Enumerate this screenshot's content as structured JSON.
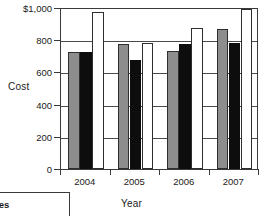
{
  "chart_data": {
    "type": "bar",
    "title": "",
    "xlabel": "Year",
    "ylabel": "Cost",
    "categories": [
      "2004",
      "2005",
      "2006",
      "2007"
    ],
    "series": [
      {
        "name": "series-gray",
        "color": "#8d8d8d",
        "values": [
          727,
          776,
          735,
          870
        ]
      },
      {
        "name": "series-black",
        "color": "#0d0d0d",
        "values": [
          727,
          677,
          776,
          782
        ]
      },
      {
        "name": "series-white",
        "color": "#ffffff",
        "values": [
          975,
          782,
          876,
          993
        ]
      }
    ],
    "ylim": [
      0,
      1000
    ],
    "yticks": [
      0,
      200,
      400,
      600,
      800,
      1000
    ],
    "ytick_labels": [
      "0",
      "200",
      "400",
      "600",
      "800",
      "$1,000"
    ],
    "grid": true,
    "legend_position": "bottom-left-cropped"
  },
  "legend": {
    "cropped_label": "les"
  }
}
